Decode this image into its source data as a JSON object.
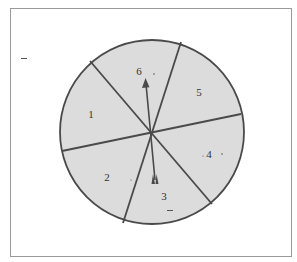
{
  "figure": {
    "type": "spinner",
    "sector_count": 6,
    "colors": {
      "background": "#ffffff",
      "frame": "#9a9a9a",
      "sector_fill": "#dcdcdc",
      "outline": "#4a4a4a",
      "label": "#333333"
    },
    "sectors": [
      {
        "label": "1"
      },
      {
        "label": "2"
      },
      {
        "label": "3"
      },
      {
        "label": "4"
      },
      {
        "label": "5"
      },
      {
        "label": "6"
      }
    ],
    "pointer": {
      "points_to": "6"
    }
  }
}
